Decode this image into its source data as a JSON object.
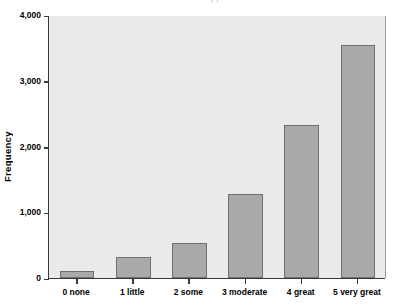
{
  "chart_data": {
    "type": "bar",
    "title": "",
    "clipped_title_fragment": "pp",
    "xlabel": "",
    "ylabel": "Frequency",
    "categories": [
      "0 none",
      "1 little",
      "2 some",
      "3 moderate",
      "4 great",
      "5 very great"
    ],
    "values": [
      110,
      320,
      525,
      1280,
      2330,
      3550
    ],
    "ylim": [
      0,
      4000
    ],
    "yticks": [
      0,
      1000,
      2000,
      3000,
      4000
    ],
    "ytick_labels": [
      "0",
      "1,000",
      "2,000",
      "3,000",
      "4,000"
    ],
    "grid": false,
    "legend": false,
    "bar_color": "#a9a9a9",
    "bar_edge_color": "#6f6f6f",
    "plot_background": "#eaeaea",
    "axis_color": "#3a3a3a",
    "page_background": "#ffffff"
  }
}
